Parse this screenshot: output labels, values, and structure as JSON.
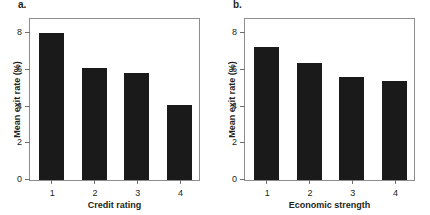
{
  "figure": {
    "panels": [
      {
        "letter": "a.",
        "ylabel": "Mean exit rate (%)",
        "xlabel": "Credit rating"
      },
      {
        "letter": "b.",
        "ylabel": "Mean exit rate (%)",
        "xlabel": "Economic strength"
      }
    ]
  },
  "chart_data": [
    {
      "type": "bar",
      "title": "a.",
      "categories": [
        "1",
        "2",
        "3",
        "4"
      ],
      "values": [
        8.0,
        6.1,
        5.85,
        4.1
      ],
      "xlabel": "Credit rating",
      "ylabel": "Mean exit rate (%)",
      "ylim": [
        0,
        8.9
      ],
      "yticks": [
        0,
        2,
        4,
        6,
        8
      ],
      "ytick_labels": [
        "0",
        "2",
        "4",
        "6",
        "8"
      ],
      "grid": false,
      "legend": false,
      "bar_color": "#1a1a1a",
      "frame": true
    },
    {
      "type": "bar",
      "title": "b.",
      "categories": [
        "1",
        "2",
        "3",
        "4"
      ],
      "values": [
        7.25,
        6.4,
        5.65,
        5.4
      ],
      "xlabel": "Economic strength",
      "ylabel": "Mean exit rate (%)",
      "ylim": [
        0,
        8.9
      ],
      "yticks": [
        0,
        2,
        4,
        6,
        8
      ],
      "ytick_labels": [
        "0",
        "2",
        "4",
        "6",
        "8"
      ],
      "grid": false,
      "legend": false,
      "bar_color": "#1a1a1a",
      "frame": true
    }
  ]
}
